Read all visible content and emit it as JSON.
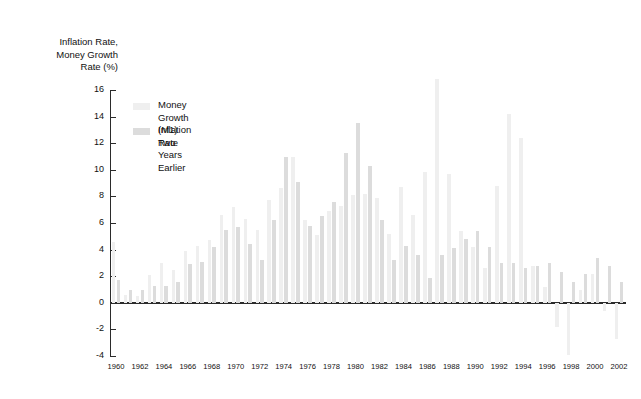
{
  "axis_title": "Inflation Rate,\nMoney Growth\nRate (%)",
  "legend": {
    "m1_label": "Money Growth (M1)\nTwo Years Earlier",
    "inflation_label": "Inflation Rate"
  },
  "colors": {
    "money_growth": "#efefef",
    "inflation": "#dcdcdc",
    "axis": "#2b2b2b",
    "background": "#ffffff",
    "text": "#111111"
  },
  "chart_data": {
    "type": "bar",
    "title": "",
    "subtitle": "",
    "xlabel": "",
    "ylabel": "Inflation Rate, Money Growth Rate (%)",
    "ylim": [
      -4,
      16
    ],
    "yticks": [
      16,
      14,
      12,
      10,
      8,
      6,
      4,
      2,
      0,
      -2,
      -4
    ],
    "ytick_labels": [
      "16",
      "14",
      "12",
      "10",
      "8",
      "6",
      "4",
      "2",
      "0",
      "-2",
      "-4"
    ],
    "xlim": [
      1960,
      2002
    ],
    "xticks": [
      1960,
      1962,
      1964,
      1966,
      1968,
      1970,
      1972,
      1974,
      1976,
      1978,
      1980,
      1982,
      1984,
      1986,
      1988,
      1990,
      1992,
      1994,
      1996,
      1998,
      2000,
      2002
    ],
    "xtick_labels": [
      "1960",
      "1962",
      "1964",
      "1966",
      "1968",
      "1970",
      "1972",
      "1974",
      "1976",
      "1978",
      "1980",
      "1982",
      "1984",
      "1986",
      "1988",
      "1990",
      "1992",
      "1994",
      "1996",
      "1998",
      "2000",
      "2002"
    ],
    "grid": false,
    "legend_position": "upper-left",
    "categories": [
      1960,
      1961,
      1962,
      1963,
      1964,
      1965,
      1966,
      1967,
      1968,
      1969,
      1970,
      1971,
      1972,
      1973,
      1974,
      1975,
      1976,
      1977,
      1978,
      1979,
      1980,
      1981,
      1982,
      1983,
      1984,
      1985,
      1986,
      1987,
      1988,
      1989,
      1990,
      1991,
      1992,
      1993,
      1994,
      1995,
      1996,
      1997,
      1998,
      1999,
      2000,
      2001,
      2002
    ],
    "series": [
      {
        "name": "Money Growth (M1) Two Years Earlier",
        "values": [
          4.6,
          0.6,
          0.5,
          2.1,
          3.0,
          2.5,
          3.9,
          4.3,
          4.7,
          6.6,
          7.2,
          6.3,
          5.5,
          7.7,
          8.6,
          11.0,
          6.2,
          5.1,
          6.9,
          7.3,
          8.1,
          8.2,
          7.9,
          5.2,
          8.7,
          6.6,
          9.8,
          16.8,
          9.7,
          5.4,
          4.2,
          2.6,
          8.8,
          14.2,
          12.4,
          2.8,
          1.2,
          -1.8,
          -3.9,
          1.0,
          2.2,
          -0.6,
          -2.7
        ]
      },
      {
        "name": "Inflation Rate",
        "values": [
          1.7,
          1.0,
          1.0,
          1.3,
          1.3,
          1.6,
          2.9,
          3.1,
          4.2,
          5.5,
          5.7,
          4.4,
          3.2,
          6.2,
          11.0,
          9.1,
          5.8,
          6.5,
          7.6,
          11.3,
          13.5,
          10.3,
          6.2,
          3.2,
          4.3,
          3.6,
          1.9,
          3.6,
          4.1,
          4.8,
          5.4,
          4.2,
          3.0,
          3.0,
          2.6,
          2.8,
          3.0,
          2.3,
          1.6,
          2.2,
          3.4,
          2.8,
          1.6
        ]
      }
    ]
  }
}
